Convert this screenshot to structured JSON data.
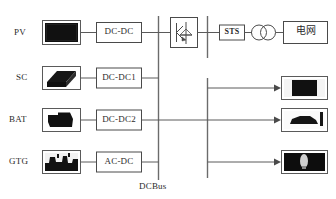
{
  "diagram": {
    "bus_label": "DCBus",
    "colors": {
      "wire": "#5a5a5a",
      "bus": "#6b6b6b",
      "box_stroke": "#4a4a4a",
      "text": "#2b2b2b",
      "background": "#ffffff",
      "thumbnail_dark": "#101010"
    }
  },
  "sources": [
    {
      "label": "PV",
      "thumbnail": "solar-panel-photo",
      "converter": "DC-DC"
    },
    {
      "label": "SC",
      "thumbnail": "supercapacitor-photo",
      "converter": "DC-DC1"
    },
    {
      "label": "BAT",
      "thumbnail": "battery-photo",
      "converter": "DC-DC2"
    },
    {
      "label": "GTG",
      "thumbnail": "gas-turbine-generator-photo",
      "converter": "AC-DC"
    }
  ],
  "grid_branch": {
    "inverter": "igbt-inverter-symbol",
    "sts": "STS",
    "transformer": "two-winding-transformer-symbol",
    "grid": "电网"
  },
  "loads": [
    {
      "thumbnail": "dc-load-appliance-photo"
    },
    {
      "thumbnail": "electric-vehicle-charging-photo"
    },
    {
      "thumbnail": "lighting-load-photo"
    }
  ]
}
